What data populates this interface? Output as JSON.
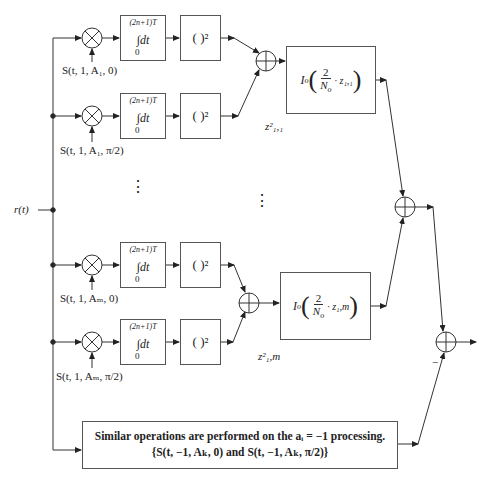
{
  "input": {
    "label": "r(t)"
  },
  "rows": [
    {
      "id": "row-1",
      "reference": "S(t, 1, A₁, 0)",
      "integrator": {
        "upper": "(2n+1)T",
        "body": "∫dt",
        "lower": "0"
      },
      "squarer": "( )²"
    },
    {
      "id": "row-2",
      "reference": "S(t, 1, A₁, π/2)",
      "integrator": {
        "upper": "(2n+1)T",
        "body": "∫dt",
        "lower": "0"
      },
      "squarer": "( )²"
    },
    {
      "id": "row-3",
      "reference": "S(t, 1, Aₘ, 0)",
      "integrator": {
        "upper": "(2n+1)T",
        "body": "∫dt",
        "lower": "0"
      },
      "squarer": "( )²"
    },
    {
      "id": "row-4",
      "reference": "S(t, 1, Aₘ, π/2)",
      "integrator": {
        "upper": "(2n+1)T",
        "body": "∫dt",
        "lower": "0"
      },
      "squarer": "( )²"
    }
  ],
  "bessel_blocks": [
    {
      "func": "I",
      "sub": "o",
      "num": "2",
      "den": "N",
      "den_sub": "o",
      "arg": "· z₁,₁",
      "z_label": "z²₁,₁"
    },
    {
      "func": "I",
      "sub": "o",
      "num": "2",
      "den": "N",
      "den_sub": "o",
      "arg": "· z₁,m",
      "z_label": "z²₁,m"
    }
  ],
  "ellipsis": "⋮",
  "final_sum": {
    "minus_sign": "−"
  },
  "bottom_box": {
    "line1": "Similar operations are performed on the aᵢ = −1 processing.",
    "line2": "{S(t, −1, Aₖ, 0) and S(t, −1, Aₖ, π/2)}"
  }
}
